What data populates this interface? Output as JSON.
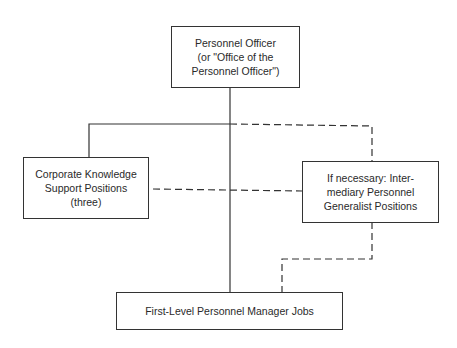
{
  "diagram": {
    "nodes": [
      {
        "id": "personnel-officer",
        "label": "Personnel Officer\n(or \"Office of the\nPersonnel Officer\")"
      },
      {
        "id": "corporate-knowledge",
        "label": "Corporate Knowledge\nSupport Positions\n(three)"
      },
      {
        "id": "intermediary",
        "label": "If necessary: Inter-\nmediary Personnel\nGeneralist Positions"
      },
      {
        "id": "first-level",
        "label": "First-Level Personnel Manager Jobs"
      }
    ],
    "edges": [
      {
        "from": "personnel-officer",
        "to": "first-level",
        "style": "solid"
      },
      {
        "from": "personnel-officer",
        "to": "corporate-knowledge",
        "style": "solid"
      },
      {
        "from": "personnel-officer",
        "to": "intermediary",
        "style": "dashed"
      },
      {
        "from": "corporate-knowledge",
        "to": "intermediary",
        "style": "dashed"
      },
      {
        "from": "intermediary",
        "to": "first-level",
        "style": "dashed"
      }
    ],
    "colors": {
      "line": "#333333",
      "background": "#ffffff"
    }
  }
}
